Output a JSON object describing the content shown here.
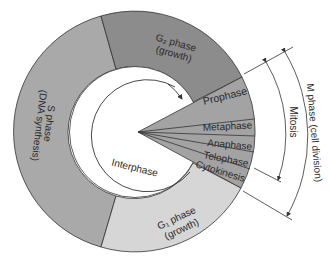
{
  "colors": {
    "s_phase": "#a9a9a9",
    "g2_phase": "#8c8c8c",
    "g1_phase": "#d4d4d4",
    "mitosis_wedge": "#a3a3a3",
    "outline": "#333333",
    "background": "#ffffff"
  },
  "segments": {
    "s_phase": {
      "name": "S phase",
      "detail": "(DNA synthesis)"
    },
    "g2_phase": {
      "name": "G₂ phase",
      "detail": "(growth)"
    },
    "g1_phase": {
      "name": "G₁ phase",
      "detail": "(growth)"
    }
  },
  "center_label": "Interphase",
  "mitosis_stages": [
    "Prophase",
    "Metaphase",
    "Anaphase",
    "Telophase",
    "Cytokinesis"
  ],
  "brackets": {
    "mitosis": "Mitosis",
    "m_phase": "M phase (cell division)"
  }
}
